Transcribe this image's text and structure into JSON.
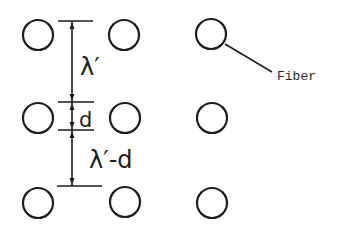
{
  "diagram": {
    "title": "",
    "colors": {
      "ink": "#1e1e1e",
      "background": "#ffffff"
    },
    "labels": {
      "lambda": "λ′",
      "d": "d",
      "lambda_minus_d": "λ′-d",
      "fiber": "Fiber"
    },
    "fibers": [
      {
        "id": "r1c1",
        "cx": 38,
        "cy": 35,
        "r": 15
      },
      {
        "id": "r1c2",
        "cx": 124,
        "cy": 35,
        "r": 15
      },
      {
        "id": "r1c3",
        "cx": 211,
        "cy": 34,
        "r": 15
      },
      {
        "id": "r2c1",
        "cx": 38,
        "cy": 118,
        "r": 15
      },
      {
        "id": "r2c2",
        "cx": 125,
        "cy": 118,
        "r": 15
      },
      {
        "id": "r2c3",
        "cx": 212,
        "cy": 118,
        "r": 15
      },
      {
        "id": "r3c1",
        "cx": 38,
        "cy": 203,
        "r": 15
      },
      {
        "id": "r3c2",
        "cx": 125,
        "cy": 202,
        "r": 15
      },
      {
        "id": "r3c3",
        "cx": 212,
        "cy": 203,
        "r": 15
      }
    ],
    "dimensions": [
      {
        "name": "lambda",
        "from_y": 21,
        "to_y": 102,
        "label": "λ′"
      },
      {
        "name": "d",
        "from_y": 102,
        "to_y": 130,
        "label": "d"
      },
      {
        "name": "lambda_minus_d",
        "from_y": 130,
        "to_y": 186,
        "label": "λ′-d"
      }
    ]
  }
}
